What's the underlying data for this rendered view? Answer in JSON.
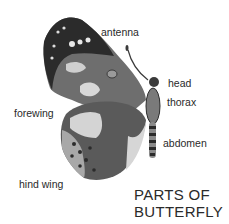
{
  "diagram": {
    "title_line1": "PARTS OF",
    "title_line2": "BUTTERFLY",
    "labels": {
      "antenna": "antenna",
      "head": "head",
      "thorax": "thorax",
      "forewing": "forewing",
      "abdomen": "abdomen",
      "hind_wing": "hind wing"
    },
    "colors": {
      "text": "#2a2a2a",
      "wing_dark": "#2b2b2b",
      "wing_mid": "#6e6e6e",
      "wing_light": "#c9c9c9",
      "background": "#ffffff"
    }
  }
}
